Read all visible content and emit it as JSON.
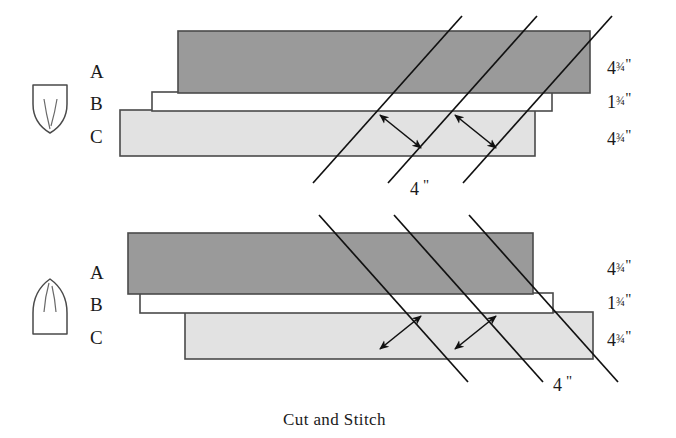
{
  "figure": {
    "caption": "Cut and Stitch",
    "colors": {
      "strip_a_fill": "#9a9a9a",
      "strip_b_fill": "#ffffff",
      "strip_c_fill": "#e2e2e2",
      "outline": "#4a4a4a",
      "cut_line": "#1a1a1a",
      "text": "#1a1a1a",
      "background": "#ffffff"
    },
    "panels": [
      {
        "id": "top-panel",
        "template_icon": "leaf-point-down-icon",
        "cut_direction": "up-right",
        "row_labels": [
          "A",
          "B",
          "C"
        ],
        "measurements": [
          {
            "whole": "4",
            "fraction": "¾",
            "unit": "\""
          },
          {
            "whole": "1",
            "fraction": "¾",
            "unit": "\""
          },
          {
            "whole": "4",
            "fraction": "¾",
            "unit": "\""
          }
        ],
        "spacing": {
          "value": "4",
          "unit": "\""
        }
      },
      {
        "id": "bottom-panel",
        "template_icon": "leaf-point-up-icon",
        "cut_direction": "down-right",
        "row_labels": [
          "A",
          "B",
          "C"
        ],
        "measurements": [
          {
            "whole": "4",
            "fraction": "¾",
            "unit": "\""
          },
          {
            "whole": "1",
            "fraction": "¾",
            "unit": "\""
          },
          {
            "whole": "4",
            "fraction": "¾",
            "unit": "\""
          }
        ],
        "spacing": {
          "value": "4",
          "unit": "\""
        }
      }
    ]
  },
  "top": {
    "letters": {
      "a": "A",
      "b": "B",
      "c": "C"
    },
    "m0": {
      "whole": "4",
      "frac": "¾",
      "inch": "\""
    },
    "m1": {
      "whole": "1",
      "frac": "¾",
      "inch": "\""
    },
    "m2": {
      "whole": "4",
      "frac": "¾",
      "inch": "\""
    },
    "spacing": {
      "value": "4",
      "inch": "\""
    }
  },
  "bottom": {
    "letters": {
      "a": "A",
      "b": "B",
      "c": "C"
    },
    "m0": {
      "whole": "4",
      "frac": "¾",
      "inch": "\""
    },
    "m1": {
      "whole": "1",
      "frac": "¾",
      "inch": "\""
    },
    "m2": {
      "whole": "4",
      "frac": "¾",
      "inch": "\""
    },
    "spacing": {
      "value": "4",
      "inch": "\""
    }
  },
  "caption": {
    "text": "Cut and Stitch"
  }
}
